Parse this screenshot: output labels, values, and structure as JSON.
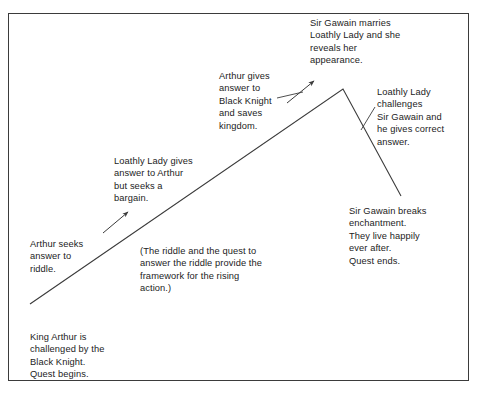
{
  "diagram": {
    "type": "freytag-plot-arc",
    "frame": {
      "border_color": "#3b3b3b",
      "background": "#ffffff",
      "x": 8,
      "y": 13,
      "width": 461,
      "height": 368
    },
    "arc": {
      "stroke_color": "#3b3b3b",
      "stroke_width": 1,
      "points": [
        {
          "name": "exposition-start",
          "x": 30,
          "y": 304
        },
        {
          "name": "climax-apex",
          "x": 343,
          "y": 89
        },
        {
          "name": "resolution-end",
          "x": 401,
          "y": 196
        }
      ]
    },
    "arrows": [
      {
        "name": "arrow-to-rising-1",
        "from_x": 103,
        "from_y": 233,
        "to_x": 129,
        "to_y": 212,
        "points_to": "rising-action-1"
      },
      {
        "name": "arrow-to-climax",
        "from_x": 287,
        "from_y": 103,
        "to_x": 315,
        "to_y": 80,
        "points_to": "climax"
      }
    ],
    "connector_lines": [
      {
        "name": "connector-rising-2",
        "from_x": 277,
        "from_y": 97,
        "to_x": 302,
        "to_y": 92
      },
      {
        "name": "connector-falling-1",
        "from_x": 362,
        "from_y": 129,
        "to_x": 376,
        "to_y": 106
      }
    ],
    "labels": {
      "climax": "Sir Gawain marries\nLoathly Lady and she\nreveals her\nappearance.",
      "rising_action_2": "Arthur gives\nanswer to\nBlack Knight\nand saves\nkingdom.",
      "falling_action_1": "Loathly Lady\nchallenges\nSir Gawain and\nhe gives correct\nanswer.",
      "rising_action_1": "Loathly Lady gives\nanswer to Arthur\nbut seeks a\nbargain.",
      "resolution": "Sir Gawain breaks\nenchantment.\nThey live happily\never after.\nQuest ends.",
      "inciting_incident": "Arthur seeks\nanswer to\nriddle.",
      "aside_note": "(The riddle and the quest to\nanswer the riddle provide the\nframework for the rising\naction.)",
      "exposition": "King Arthur is\nchallenged by the\nBlack Knight.\nQuest begins."
    }
  }
}
